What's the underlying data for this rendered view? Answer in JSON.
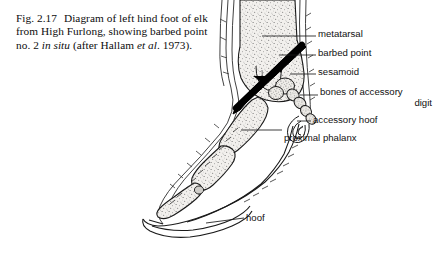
{
  "figure": {
    "number": "Fig. 2.17",
    "caption_part1": "Diagram of left hind foot of elk from High Furlong, showing barbed point no. 2 ",
    "caption_italic1": "in situ",
    "caption_part2": " (after Hallam ",
    "caption_italic2": "et al",
    "caption_part3": ". 1973)."
  },
  "labels": {
    "metatarsal": "metatarsal",
    "barbed_point": "barbed point",
    "sesamoid": "sesamoid",
    "accessory_bones_line1": "bones of accessory",
    "accessory_bones_line2": "digit",
    "accessory_hoof": "accessory hoof",
    "proximal_phalanx": "proximal phalanx",
    "hoof": "hoof"
  },
  "colors": {
    "background": "#ffffff",
    "ink": "#111111",
    "outline": "#1a1a1a",
    "bone_fill": "#e8e6e2",
    "stipple": "#6b6b6b",
    "barbed_point": "#000000",
    "caption_text": "#0d0d0d"
  }
}
